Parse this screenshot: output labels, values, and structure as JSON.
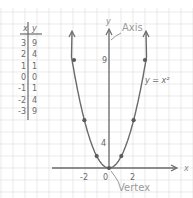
{
  "chart_data": {
    "type": "line",
    "title": "",
    "equation_label": "y = x²",
    "xlabel": "x",
    "ylabel": "y",
    "x_ticks": [
      {
        "value": -2,
        "label": "-2"
      },
      {
        "value": 0,
        "label": "0"
      },
      {
        "value": 2,
        "label": "2"
      }
    ],
    "y_ticks": [
      {
        "value": 4,
        "label": "4"
      },
      {
        "value": 9,
        "label": "9"
      }
    ],
    "annotations": [
      {
        "text": "Axis",
        "points_to": "y-axis"
      },
      {
        "text": "Vertex",
        "points_to": "(0,0)"
      }
    ],
    "series": [
      {
        "name": "y = x²",
        "x": [
          -3,
          -2,
          -1,
          0,
          1,
          2,
          3
        ],
        "y": [
          9,
          4,
          1,
          0,
          1,
          4,
          9
        ]
      }
    ],
    "table": {
      "headers": [
        "x",
        "y"
      ],
      "rows": [
        [
          "3",
          "9"
        ],
        [
          "2",
          "4"
        ],
        [
          "1",
          "1"
        ],
        [
          "0",
          "0"
        ],
        [
          "-1",
          "1"
        ],
        [
          "-2",
          "4"
        ],
        [
          "-3",
          "9"
        ]
      ]
    },
    "grid": true,
    "colors": {
      "grid": "#dcdcdc",
      "ink": "#5a5a5a",
      "annotation": "#8a8a8a"
    }
  }
}
